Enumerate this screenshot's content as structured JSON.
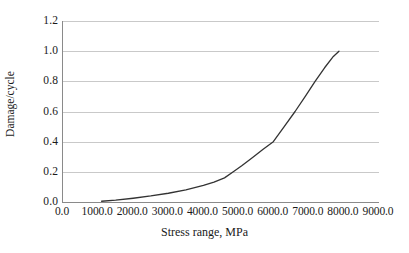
{
  "chart_data": {
    "type": "line",
    "title": "",
    "xlabel": "Stress range, MPa",
    "ylabel": "Damage/cycle",
    "xlim": [
      0,
      9000
    ],
    "ylim": [
      0,
      1.2
    ],
    "grid": true,
    "grid_axis": "y",
    "legend": false,
    "legend_position": "none",
    "line_color": "#333333",
    "grid_color": "#c9c9c9",
    "axis_color": "#8a8a8a",
    "background_color": "#ffffff",
    "xticks": [
      0,
      1000,
      2000,
      3000,
      4000,
      5000,
      6000,
      7000,
      8000,
      9000
    ],
    "xtick_labels": [
      "0.0",
      "1000.0",
      "2000.0",
      "3000.0",
      "4000.0",
      "5000.0",
      "6000.0",
      "7000.0",
      "8000.0",
      "9000.0"
    ],
    "yticks": [
      0.0,
      0.2,
      0.4,
      0.6,
      0.8,
      1.0,
      1.2
    ],
    "ytick_labels": [
      "0.0",
      "0.2",
      "0.4",
      "0.6",
      "0.8",
      "1.0",
      "1.2"
    ],
    "series": [
      {
        "name": "Damage per cycle",
        "x": [
          1100,
          1500,
          2000,
          2500,
          3000,
          3500,
          4000,
          4300,
          4600,
          4850,
          5100,
          5400,
          5700,
          5990,
          6300,
          6610,
          6900,
          7180,
          7450,
          7700,
          7860
        ],
        "y": [
          0.005,
          0.012,
          0.025,
          0.04,
          0.058,
          0.08,
          0.11,
          0.132,
          0.16,
          0.2,
          0.242,
          0.295,
          0.35,
          0.4,
          0.5,
          0.6,
          0.7,
          0.8,
          0.89,
          0.965,
          1.0
        ]
      }
    ]
  },
  "axes": {
    "y_label": "Damage/cycle",
    "x_label": "Stress range, MPa"
  }
}
